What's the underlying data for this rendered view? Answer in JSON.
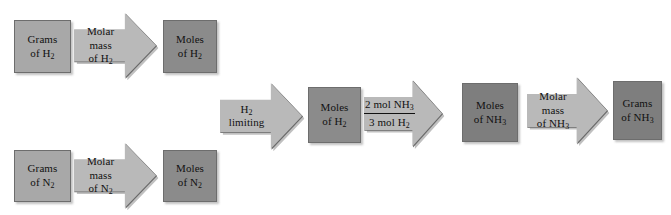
{
  "diagram": {
    "type": "flowchart",
    "colors": {
      "box_light": "#a8a8a8",
      "box_dark": "#8b8b8b",
      "box_darker": "#7e7e7e",
      "arrow_fill": "#b9b9b9",
      "outline": "#6a6a6a",
      "text": "#111111",
      "background": "#ffffff"
    },
    "nodes": [
      {
        "id": "grams-h2",
        "kind": "box",
        "shade": "light",
        "lines": [
          "Grams",
          "of H₂"
        ]
      },
      {
        "id": "molar-mass-h2",
        "kind": "arrow",
        "lines": [
          "Molar",
          "mass",
          "of H₂"
        ]
      },
      {
        "id": "moles-h2-top",
        "kind": "box",
        "shade": "dark",
        "lines": [
          "Moles",
          "of H₂"
        ]
      },
      {
        "id": "grams-n2",
        "kind": "box",
        "shade": "light",
        "lines": [
          "Grams",
          "of N₂"
        ]
      },
      {
        "id": "molar-mass-n2",
        "kind": "arrow",
        "lines": [
          "Molar",
          "mass",
          "of N₂"
        ]
      },
      {
        "id": "moles-n2",
        "kind": "box",
        "shade": "dark",
        "lines": [
          "Moles",
          "of N₂"
        ]
      },
      {
        "id": "h2-limiting",
        "kind": "arrow",
        "lines": [
          "H₂",
          "limiting"
        ]
      },
      {
        "id": "moles-h2-mid",
        "kind": "box",
        "shade": "dark",
        "lines": [
          "Moles",
          "of H₂"
        ]
      },
      {
        "id": "mole-ratio",
        "kind": "arrow-fraction",
        "numerator": "2 mol NH₃",
        "denominator": "3 mol H₂"
      },
      {
        "id": "moles-nh3",
        "kind": "box",
        "shade": "darker",
        "lines": [
          "Moles",
          "of NH₃"
        ]
      },
      {
        "id": "molar-mass-nh3",
        "kind": "arrow",
        "lines": [
          "Molar",
          "mass",
          "of NH₃"
        ]
      },
      {
        "id": "grams-nh3",
        "kind": "box",
        "shade": "darker",
        "lines": [
          "Grams",
          "of NH₃"
        ]
      }
    ]
  }
}
